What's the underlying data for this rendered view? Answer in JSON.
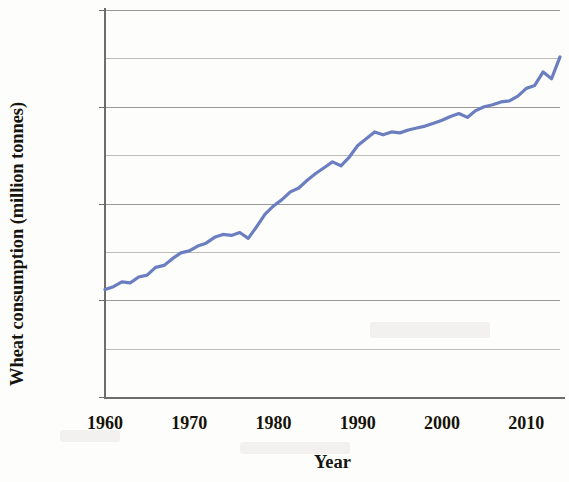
{
  "chart_data": {
    "type": "line",
    "title": "",
    "xlabel": "Year",
    "ylabel": "Wheat consumption (million tonnes)",
    "xlim": [
      1960,
      2014
    ],
    "ylim": [
      0,
      800
    ],
    "xticks": [
      "1960",
      "1970",
      "1980",
      "1990",
      "2000",
      "2010"
    ],
    "xtick_values": [
      1960,
      1970,
      1980,
      1990,
      2000,
      2010
    ],
    "yticks": [
      "0",
      "200",
      "400",
      "600",
      "800"
    ],
    "ytick_values": [
      0,
      200,
      400,
      600,
      800
    ],
    "minor_gridline_values": [
      100,
      300,
      500,
      700
    ],
    "grid": true,
    "legend": "none",
    "line_color": "#6b7fc0",
    "line_width": 3.2,
    "series": [
      {
        "name": "Wheat consumption",
        "x": [
          1960,
          1961,
          1962,
          1963,
          1964,
          1965,
          1966,
          1967,
          1968,
          1969,
          1970,
          1971,
          1972,
          1973,
          1974,
          1975,
          1976,
          1977,
          1978,
          1979,
          1980,
          1981,
          1982,
          1983,
          1984,
          1985,
          1986,
          1987,
          1988,
          1989,
          1990,
          1991,
          1992,
          1993,
          1994,
          1995,
          1996,
          1997,
          1998,
          1999,
          2000,
          2001,
          2002,
          2003,
          2004,
          2005,
          2006,
          2007,
          2008,
          2009,
          2010,
          2011,
          2012,
          2013,
          2014
        ],
        "values": [
          222,
          228,
          238,
          236,
          248,
          252,
          268,
          272,
          286,
          298,
          302,
          312,
          318,
          330,
          336,
          334,
          340,
          328,
          352,
          378,
          395,
          408,
          424,
          432,
          448,
          462,
          474,
          486,
          478,
          496,
          520,
          534,
          548,
          542,
          548,
          546,
          552,
          556,
          560,
          566,
          572,
          580,
          586,
          578,
          592,
          600,
          604,
          610,
          612,
          622,
          638,
          644,
          672,
          658,
          703
        ]
      }
    ]
  }
}
